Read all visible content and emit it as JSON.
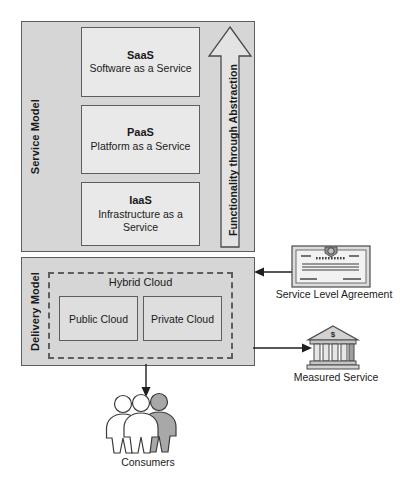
{
  "diagram": {
    "colors": {
      "panel_fill": "#d6d6d6",
      "box_fill": "#e9e9e9",
      "cloud_fill": "#dedede",
      "stroke": "#5d5d5d",
      "text": "#1a1a1a",
      "consumer_highlight": "#a8a8a8"
    }
  },
  "service_model": {
    "label": "Service Model",
    "layers": [
      {
        "abbr": "SaaS",
        "name": "Software as a Service"
      },
      {
        "abbr": "PaaS",
        "name": "Platform as a Service"
      },
      {
        "abbr": "IaaS",
        "name": "Infrastructure as a Service"
      }
    ],
    "arrow_label": "Functionality through Abstraction",
    "arrow_direction": "up"
  },
  "delivery_model": {
    "label": "Delivery Model",
    "hybrid_cloud": {
      "title": "Hybrid Cloud",
      "clouds": [
        {
          "label": "Public Cloud"
        },
        {
          "label": "Private Cloud"
        }
      ]
    }
  },
  "side_nodes": [
    {
      "caption": "Service Level Agreement",
      "icon": "certificate-icon",
      "arrow_direction": "left",
      "arrow_target": "delivery-model"
    },
    {
      "caption": "Measured Service",
      "icon": "bank-icon",
      "icon_symbol": "$",
      "arrow_direction": "right",
      "arrow_source": "delivery-model"
    }
  ],
  "bottom_node": {
    "caption": "Consumers",
    "icon": "people-group-icon",
    "people_count": 3,
    "arrow_direction": "down",
    "arrow_source": "delivery-model"
  }
}
